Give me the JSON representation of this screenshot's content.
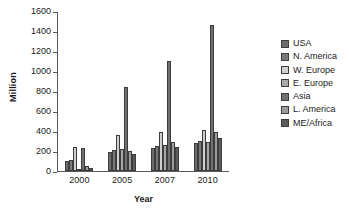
{
  "chart_data": {
    "type": "bar",
    "title": "",
    "xlabel": "Year",
    "ylabel": "Million",
    "categories": [
      "2000",
      "2005",
      "2007",
      "2010"
    ],
    "ylim": [
      0,
      1600
    ],
    "yticks": [
      0,
      200,
      400,
      600,
      800,
      1000,
      1200,
      1400,
      1600
    ],
    "ytick_labels": [
      "0",
      "200",
      "400",
      "600",
      "800",
      "1000",
      "1200",
      "1400",
      "1600"
    ],
    "grid": false,
    "legend_position": "right",
    "series": [
      {
        "name": "USA",
        "color": "#6b6b6b",
        "values": [
          100,
          195,
          230,
          285
        ]
      },
      {
        "name": "N. America",
        "color": "#797979",
        "values": [
          110,
          210,
          250,
          300
        ]
      },
      {
        "name": "W. Europe",
        "color": "#cfcfcf",
        "values": [
          245,
          365,
          390,
          410
        ]
      },
      {
        "name": "E. Europe",
        "color": "#a8a8a8",
        "values": [
          25,
          220,
          265,
          295
        ]
      },
      {
        "name": "Asia",
        "color": "#707070",
        "values": [
          235,
          840,
          1105,
          1460
        ]
      },
      {
        "name": "L. America",
        "color": "#9c9c9c",
        "values": [
          55,
          200,
          290,
          390
        ]
      },
      {
        "name": "ME/Africa",
        "color": "#5c5c5c",
        "values": [
          35,
          170,
          240,
          335
        ]
      }
    ]
  }
}
